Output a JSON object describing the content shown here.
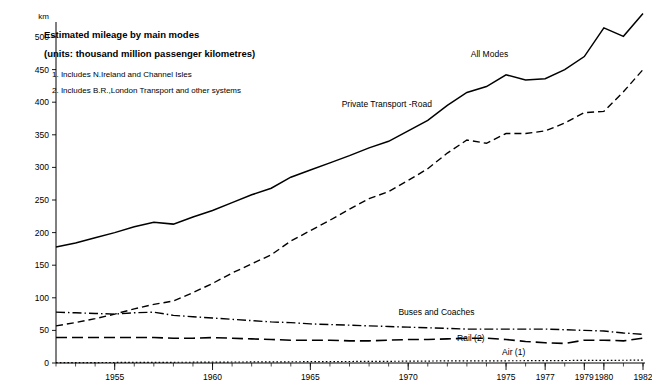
{
  "chart_data": {
    "type": "line",
    "title": "Estimated mileage by main modes",
    "subtitle": "(units: thousand million passenger kilometres)",
    "notes": [
      "1. Includes N.Ireland and Channel Isles",
      "2. Includes B.R.,London Transport and other systems"
    ],
    "ylabel": "km",
    "xlabel": "",
    "ylim": [
      0,
      520
    ],
    "yticks": [
      0,
      50,
      100,
      150,
      200,
      250,
      300,
      350,
      400,
      450,
      500
    ],
    "xlim": [
      1952,
      1982
    ],
    "xticks": [
      1955,
      1960,
      1965,
      1970,
      1975,
      1977,
      1979,
      1980,
      1982
    ],
    "xticklabels": [
      "1955",
      "1960",
      "1965",
      "1970",
      "1975",
      "1977",
      "1979",
      "1980",
      "1982"
    ],
    "grid": false,
    "legend_position": "inline-annotations",
    "x": [
      1952,
      1953,
      1954,
      1955,
      1956,
      1957,
      1958,
      1959,
      1960,
      1961,
      1962,
      1963,
      1964,
      1965,
      1966,
      1967,
      1968,
      1969,
      1970,
      1971,
      1972,
      1973,
      1974,
      1975,
      1976,
      1977,
      1978,
      1979,
      1980,
      1981,
      1982
    ],
    "series": [
      {
        "name": "All Modes",
        "style": "solid",
        "label_x": 1973.2,
        "label_y": 470,
        "values": [
          178,
          184,
          192,
          200,
          209,
          216,
          213,
          224,
          234,
          246,
          258,
          268,
          285,
          296,
          307,
          318,
          330,
          340,
          356,
          372,
          395,
          415,
          424,
          442,
          434,
          436,
          450,
          470,
          514,
          501,
          536
        ]
      },
      {
        "name": "Private Transport -Road",
        "style": "dashed",
        "label_x": 1966.6,
        "label_y": 392,
        "values": [
          57,
          62,
          68,
          75,
          83,
          90,
          95,
          108,
          122,
          138,
          152,
          166,
          187,
          203,
          219,
          236,
          252,
          263,
          280,
          298,
          322,
          342,
          337,
          352,
          352,
          356,
          368,
          384,
          386,
          416,
          450
        ]
      },
      {
        "name": "Buses and Coaches",
        "style": "dashdot",
        "label_x": 1969.5,
        "label_y": 73,
        "values": [
          78,
          77,
          76,
          75,
          77,
          78,
          73,
          71,
          69,
          67,
          65,
          63,
          62,
          60,
          59,
          58,
          57,
          56,
          55,
          54,
          53,
          52,
          52,
          52,
          52,
          52,
          51,
          50,
          49,
          46,
          44
        ]
      },
      {
        "name": "Rail (2)",
        "style": "longdash",
        "label_x": 1972.5,
        "label_y": 33,
        "values": [
          39,
          39,
          39,
          39,
          39,
          39,
          38,
          38,
          39,
          38,
          37,
          36,
          35,
          35,
          35,
          34,
          34,
          35,
          36,
          36,
          37,
          38,
          38,
          36,
          33,
          31,
          30,
          35,
          35,
          34,
          38
        ]
      },
      {
        "name": "Air (1)",
        "style": "dotted",
        "label_x": 1974.8,
        "label_y": 12,
        "values": [
          0.5,
          0.6,
          0.7,
          0.8,
          0.9,
          1.0,
          1.1,
          1.2,
          1.4,
          1.5,
          1.6,
          1.7,
          1.9,
          2.0,
          2.2,
          2.3,
          2.5,
          2.6,
          2.8,
          3.0,
          3.2,
          3.4,
          3.3,
          3.4,
          3.5,
          3.6,
          3.8,
          4.0,
          4.1,
          4.2,
          4.4
        ]
      }
    ]
  }
}
